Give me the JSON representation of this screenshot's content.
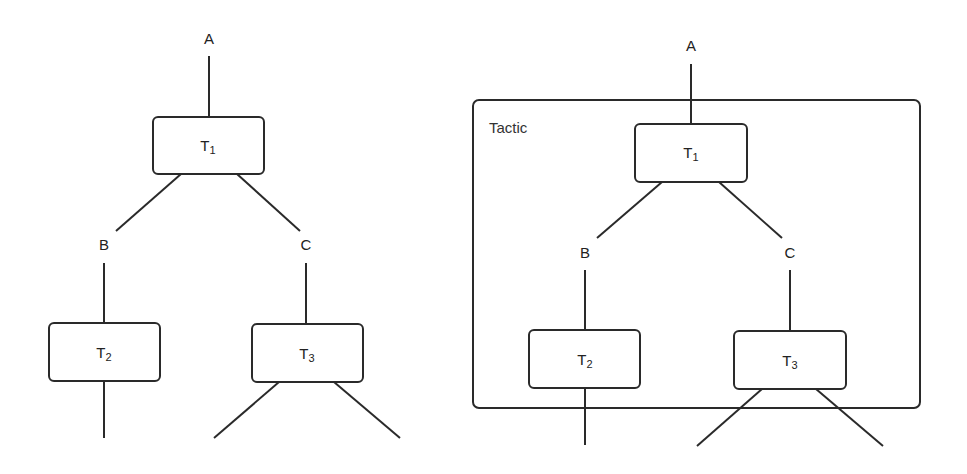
{
  "diagram": {
    "colors": {
      "stroke": "#2a2a2a",
      "text": "#222222",
      "background": "#ffffff"
    },
    "left_tree": {
      "edge_labels": {
        "a": "A",
        "b": "B",
        "c": "C"
      },
      "nodes": {
        "t1": {
          "base": "T",
          "sub": "1"
        },
        "t2": {
          "base": "T",
          "sub": "2"
        },
        "t3": {
          "base": "T",
          "sub": "3"
        }
      }
    },
    "right_tree": {
      "frame_label": "Tactic",
      "edge_labels": {
        "a": "A",
        "b": "B",
        "c": "C"
      },
      "nodes": {
        "t1": {
          "base": "T",
          "sub": "1"
        },
        "t2": {
          "base": "T",
          "sub": "2"
        },
        "t3": {
          "base": "T",
          "sub": "3"
        }
      }
    }
  }
}
